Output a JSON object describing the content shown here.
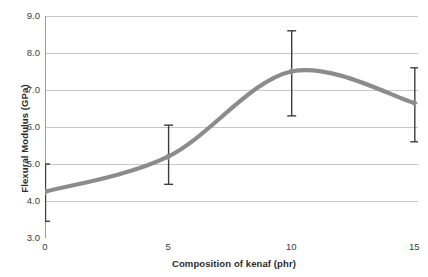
{
  "chart_data": {
    "type": "line",
    "title": "",
    "subtitle": "",
    "xlabel": "Composition of kenaf (phr)",
    "ylabel": "Flexural Modulus (GPa)",
    "x": [
      0,
      5,
      10,
      15
    ],
    "values": [
      4.25,
      5.2,
      7.5,
      6.65
    ],
    "series": [
      {
        "name": "Flexural Modulus",
        "values": [
          4.25,
          5.2,
          7.5,
          6.65
        ],
        "error_low": [
          3.45,
          4.45,
          6.3,
          5.6
        ],
        "error_high": [
          5.0,
          6.05,
          8.6,
          7.6
        ],
        "color": "#8c8c8c"
      }
    ],
    "xlim": [
      0,
      15.15
    ],
    "ylim": [
      3.0,
      9.0
    ],
    "xticks": [
      0,
      5,
      10,
      15
    ],
    "xtick_labels": [
      "0",
      "5",
      "10",
      "15"
    ],
    "yticks": [
      3.0,
      4.0,
      5.0,
      6.0,
      7.0,
      8.0,
      9.0
    ],
    "ytick_labels": [
      "3.0",
      "4.0",
      "5.0",
      "6.0",
      "7.0",
      "8.0",
      "9.0"
    ],
    "grid": "horizontal",
    "legend": "none",
    "smoothing": "spline",
    "marker": "diamond",
    "errorbar_color": "#3d3d3d",
    "gridline_color": "#c8c8c8",
    "axis_color": "#9a9a9a",
    "background": "#ffffff",
    "annotations": []
  }
}
